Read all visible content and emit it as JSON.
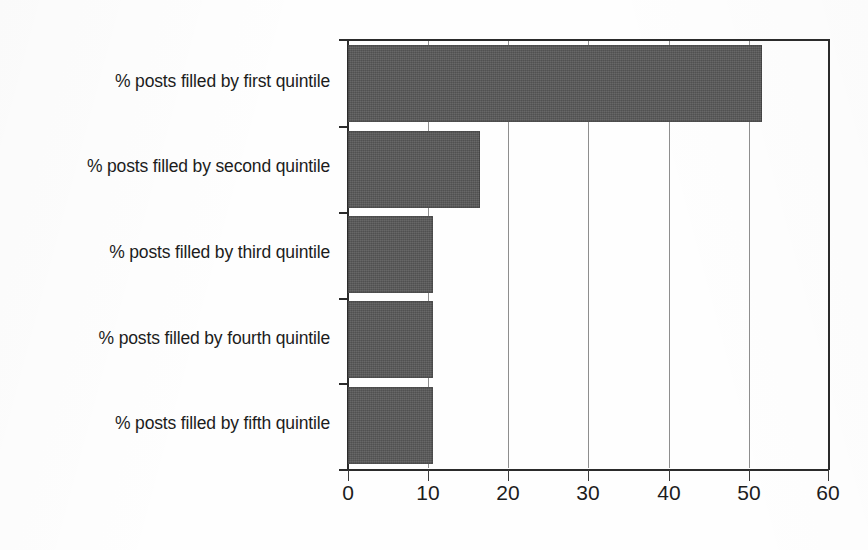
{
  "chart_data": {
    "type": "bar",
    "orientation": "horizontal",
    "title": "",
    "subtitle": "",
    "xlabel": "",
    "ylabel": "",
    "categories": [
      "% posts filled by first quintile",
      "% posts filled by second quintile",
      "% posts filled by third quintile",
      "% posts filled by fourth quintile",
      "% posts filled by fifth quintile"
    ],
    "values": [
      51.7,
      16.5,
      10.6,
      10.6,
      10.6
    ],
    "series": [
      {
        "name": "% posts filled",
        "values": [
          51.7,
          16.5,
          10.6,
          10.6,
          10.6
        ]
      }
    ],
    "xlim": [
      0,
      60
    ],
    "xticks": [
      0,
      10,
      20,
      30,
      40,
      50,
      60
    ],
    "xticklabels": [
      "0",
      "10",
      "20",
      "30",
      "40",
      "50",
      "60"
    ],
    "gridlines": [
      10,
      20,
      30,
      40,
      50
    ],
    "grid": "vertical",
    "legend": "none",
    "bar_color": "#585858",
    "axis_color": "#2b2b2b",
    "gridline_color": "#8e8e8e",
    "text_color": "#1c1c1c",
    "background_color": "#ffffff"
  }
}
